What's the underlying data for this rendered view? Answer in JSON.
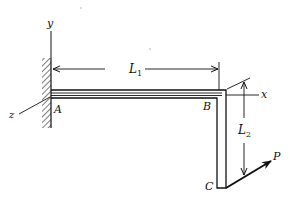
{
  "diagram": {
    "type": "structural-mechanics-figure",
    "labels": {
      "axis_y": "y",
      "axis_x": "x",
      "axis_z": "z",
      "point_a": "A",
      "point_b": "B",
      "point_c": "C",
      "load": "P",
      "length1_main": "L",
      "length1_sub": "1",
      "length2_main": "L",
      "length2_sub": "2"
    },
    "colors": {
      "ink": "#111111",
      "background": "#ffffff"
    }
  }
}
